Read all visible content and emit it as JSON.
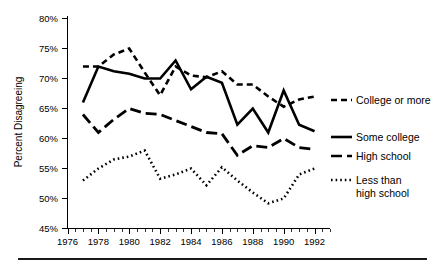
{
  "chart_data": {
    "type": "line",
    "title": "",
    "xlabel": "",
    "ylabel": "Percent Disagreeing",
    "xlim": [
      1976,
      1993
    ],
    "ylim": [
      45,
      80
    ],
    "grid": false,
    "legend_position": "right-inline",
    "x": [
      1977,
      1978,
      1979,
      1980,
      1981,
      1982,
      1983,
      1984,
      1985,
      1986,
      1987,
      1988,
      1989,
      1990,
      1991,
      1992
    ],
    "y_ticks": [
      45,
      50,
      55,
      60,
      65,
      70,
      75,
      80
    ],
    "y_tick_labels": [
      "45%",
      "50%",
      "55%",
      "60%",
      "65%",
      "70%",
      "75%",
      "80%"
    ],
    "x_ticks": [
      1976,
      1978,
      1980,
      1982,
      1984,
      1986,
      1988,
      1990,
      1992
    ],
    "x_tick_labels": [
      "1976",
      "1978",
      "1980",
      "1982",
      "1984",
      "1986",
      "1988",
      "1990",
      "1992"
    ],
    "series": [
      {
        "name": "College or more",
        "style": "short-dash",
        "values": [
          72.0,
          72.0,
          74.0,
          75.0,
          71.0,
          67.2,
          72.0,
          70.5,
          70.2,
          71.2,
          69.0,
          69.0,
          67.0,
          65.3,
          66.5,
          67.0
        ]
      },
      {
        "name": "Some college",
        "style": "solid",
        "values": [
          66.0,
          72.0,
          71.2,
          70.8,
          70.0,
          70.0,
          73.0,
          68.2,
          70.3,
          69.3,
          62.3,
          65.0,
          61.0,
          68.0,
          62.3,
          61.2
        ]
      },
      {
        "name": "High school",
        "style": "long-dash",
        "values": [
          64.0,
          61.0,
          63.2,
          65.0,
          64.2,
          64.0,
          63.0,
          62.0,
          61.0,
          60.8,
          57.2,
          58.8,
          58.5,
          60.0,
          58.5,
          58.2
        ]
      },
      {
        "name": "Less than high school",
        "style": "dotted",
        "values": [
          53.0,
          55.0,
          56.5,
          57.0,
          58.0,
          53.3,
          54.0,
          55.0,
          52.2,
          55.2,
          53.0,
          51.0,
          49.2,
          50.0,
          54.0,
          55.0
        ]
      }
    ]
  },
  "legend": {
    "entries": [
      {
        "label": "College or more"
      },
      {
        "label": "Some college"
      },
      {
        "label": "High school"
      },
      {
        "label": "Less than"
      },
      {
        "label": "high school"
      }
    ]
  }
}
